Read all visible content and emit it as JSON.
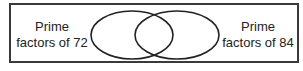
{
  "diagram": {
    "type": "venn",
    "sets": [
      {
        "id": "left",
        "label_line1": "Prime",
        "label_line2": "factors of 72"
      },
      {
        "id": "right",
        "label_line1": "Prime",
        "label_line2": "factors of 84"
      }
    ],
    "colors": {
      "stroke": "#222222",
      "frame": "#3a3a3a",
      "background": "#ffffff"
    }
  }
}
